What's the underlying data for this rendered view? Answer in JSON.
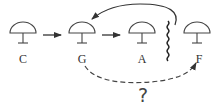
{
  "diagram": {
    "nodes": [
      {
        "id": "C",
        "label": "C",
        "cx": 23
      },
      {
        "id": "G",
        "label": "G",
        "cx": 82
      },
      {
        "id": "A",
        "label": "A",
        "cx": 142
      },
      {
        "id": "F",
        "label": "F",
        "cx": 197
      }
    ],
    "edges": [
      {
        "from": "C",
        "to": "G",
        "style": "solid"
      },
      {
        "from": "G",
        "to": "A",
        "style": "solid"
      },
      {
        "from": "barrier",
        "to": "G",
        "style": "solid-curved"
      },
      {
        "from": "G",
        "to": "F",
        "style": "dashed-curved"
      }
    ],
    "barrier": "wavy-line",
    "question_mark": "?",
    "colors": {
      "stroke": "#333333",
      "background": "#ffffff"
    }
  }
}
